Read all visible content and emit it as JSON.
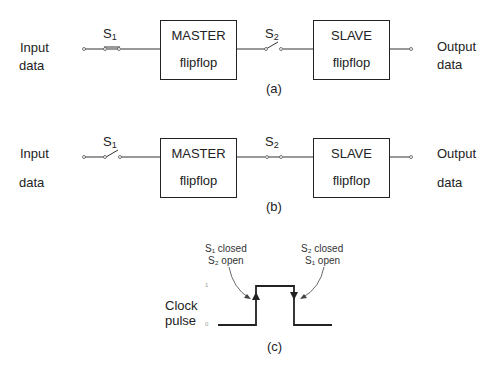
{
  "diagram_a": {
    "input_label": [
      "Input",
      "data"
    ],
    "output_label": [
      "Output",
      "data"
    ],
    "switch1": "S",
    "switch1_sub": "1",
    "switch2": "S",
    "switch2_sub": "2",
    "master": [
      "MASTER",
      "flipflop"
    ],
    "slave": [
      "SLAVE",
      "flipflop"
    ],
    "caption": "(a)",
    "state": "S1 closed, S2 open"
  },
  "diagram_b": {
    "input_label": [
      "Input",
      "data"
    ],
    "output_label": [
      "Output",
      "data"
    ],
    "switch1": "S",
    "switch1_sub": "1",
    "switch2": "S",
    "switch2_sub": "2",
    "master": [
      "MASTER",
      "flipflop"
    ],
    "slave": [
      "SLAVE",
      "flipflop"
    ],
    "caption": "(b)",
    "state": "S1 open, S2 closed"
  },
  "diagram_c": {
    "clock_label": [
      "Clock",
      "pulse"
    ],
    "level_high": "1",
    "level_low": "0",
    "rising_note": [
      "S₁ closed",
      "S₂ open"
    ],
    "falling_note": [
      "S₂ closed",
      "S₁ open"
    ],
    "caption": "(c)"
  }
}
